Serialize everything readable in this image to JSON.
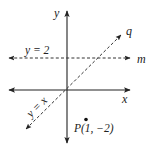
{
  "diagram": {
    "type": "coordinate-plane",
    "axes": {
      "x_label": "x",
      "y_label": "y"
    },
    "lines": [
      {
        "id": "m",
        "label": "m",
        "equation": "y = 2",
        "style": "dashed",
        "orientation": "horizontal"
      },
      {
        "id": "q",
        "label": "q",
        "equation": "y = x",
        "style": "dashed",
        "orientation": "diagonal"
      }
    ],
    "points": [
      {
        "id": "P",
        "label": "P(1, −2)",
        "x": 1,
        "y": -2
      }
    ],
    "colors": {
      "axis": "#222222",
      "dashed_line": "#333333",
      "text": "#222222"
    }
  },
  "labels": {
    "y_axis": "y",
    "x_axis": "x",
    "line_m": "m",
    "line_q": "q",
    "eq_m": "y = 2",
    "eq_q": "y = x",
    "point_p": "P(1, −2)"
  }
}
